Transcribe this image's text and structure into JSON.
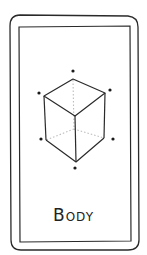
{
  "card": {
    "label": "Body",
    "icon": "wireframe-cube-icon",
    "colors": {
      "stroke": "#2a2a2a",
      "hidden_edges": "#bdbdbd",
      "background": "#ffffff"
    }
  }
}
